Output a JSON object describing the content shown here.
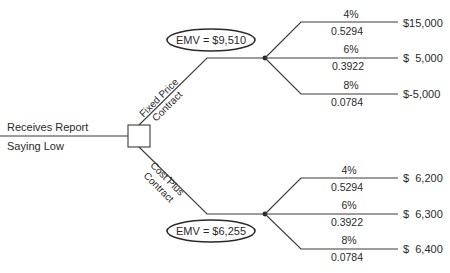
{
  "diagram": {
    "type": "decision-tree",
    "colors": {
      "line": "#3a3a3a",
      "text": "#2a2a2a",
      "background": "#ffffff"
    },
    "root": {
      "label_line1": "Receives Report",
      "label_line2": "Saying Low",
      "node_shape": "square"
    },
    "decisions": [
      {
        "id": "fixed",
        "label_line1": "Fixed Price",
        "label_line2": "Contract",
        "emv_label": "EMV = $9,510",
        "outcomes": [
          {
            "rate": "4%",
            "probability": "0.5294",
            "payoff": "$15,000"
          },
          {
            "rate": "6%",
            "probability": "0.3922",
            "payoff": "$  5,000"
          },
          {
            "rate": "8%",
            "probability": "0.0784",
            "payoff": "$-5,000"
          }
        ]
      },
      {
        "id": "costplus",
        "label_line1": "Cost Plus",
        "label_line2": "Contract",
        "emv_label": "EMV = $6,255",
        "outcomes": [
          {
            "rate": "4%",
            "probability": "0.5294",
            "payoff": "$  6,200"
          },
          {
            "rate": "6%",
            "probability": "0.3922",
            "payoff": "$  6,300"
          },
          {
            "rate": "8%",
            "probability": "0.0784",
            "payoff": "$  6,400"
          }
        ]
      }
    ]
  }
}
